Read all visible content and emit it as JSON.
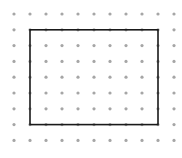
{
  "diagram": {
    "type": "dot-grid-rectangle",
    "grid": {
      "columns": 11,
      "rows": 9,
      "origin_x": 14,
      "origin_y": 14,
      "pitch_x": 16,
      "pitch_y": 15.8,
      "dot_radius": 1.6,
      "dot_color": "#a6a6a6"
    },
    "rectangle": {
      "from_col": 1,
      "from_row": 1,
      "to_col": 9,
      "to_row": 7,
      "stroke_color": "#1a1a1a",
      "stroke_width": 1.6,
      "width_units": 8,
      "height_units": 6
    }
  }
}
